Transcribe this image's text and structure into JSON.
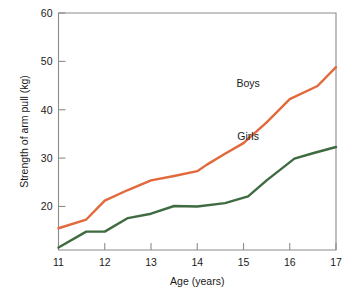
{
  "chart_data": {
    "type": "line",
    "title": "",
    "xlabel": "Age (years)",
    "ylabel": "Strength of arm pull (kg)",
    "xlim": [
      11,
      17
    ],
    "ylim": [
      11,
      60
    ],
    "xticks": [
      11,
      12,
      13,
      14,
      15,
      16,
      17
    ],
    "xtick_labels": [
      "11",
      "12",
      "13",
      "14",
      "15",
      "16",
      "17"
    ],
    "yticks": [
      20,
      30,
      40,
      50,
      60
    ],
    "ytick_labels": [
      "20",
      "30",
      "40",
      "50",
      "60"
    ],
    "grid": false,
    "legend_position": "inline-annotation",
    "series": [
      {
        "name": "Boys",
        "color": "#E2693C",
        "label_x": 15.1,
        "label_y": 44.8,
        "x": [
          11.0,
          11.6,
          12.0,
          12.5,
          13.0,
          13.5,
          14.0,
          14.2,
          14.6,
          15.0,
          15.5,
          16.0,
          16.6,
          17.0
        ],
        "values": [
          15.5,
          17.3,
          21.2,
          23.4,
          25.4,
          26.3,
          27.3,
          28.6,
          30.9,
          33.1,
          37.4,
          42.2,
          44.9,
          48.8
        ]
      },
      {
        "name": "Girls",
        "color": "#3E6B40",
        "label_x": 15.1,
        "label_y": 33.8,
        "x": [
          11.0,
          11.6,
          12.0,
          12.5,
          13.0,
          13.5,
          14.0,
          14.6,
          15.1,
          15.5,
          16.1,
          16.5,
          17.0
        ],
        "values": [
          11.5,
          14.8,
          14.8,
          17.6,
          18.5,
          20.1,
          20.0,
          20.7,
          22.1,
          25.4,
          29.9,
          31.0,
          32.3
        ]
      }
    ],
    "annotations": [
      {
        "text": "Boys",
        "x": 15.1,
        "y": 44.8
      },
      {
        "text": "Girls",
        "x": 15.1,
        "y": 33.8
      }
    ]
  }
}
